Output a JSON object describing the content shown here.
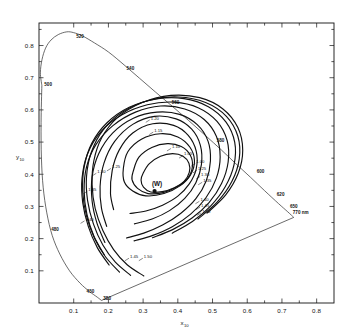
{
  "figure": {
    "kind": "cie-1964-chromaticity-diagram",
    "background": "#ffffff",
    "ink": "#111111"
  },
  "axes": {
    "x_title": "x",
    "x_subscript": "10",
    "y_title": "y",
    "y_subscript": "10",
    "x_ticks": [
      "0.1",
      "0.2",
      "0.3",
      "0.4",
      "0.5",
      "0.6",
      "0.7",
      "0.8"
    ],
    "y_ticks": [
      "0.1",
      "0.2",
      "0.3",
      "0.4",
      "0.5",
      "0.6",
      "0.7",
      "0.8"
    ],
    "xlim": [
      0.0,
      0.85
    ],
    "ylim": [
      0.0,
      0.87
    ]
  },
  "marker": {
    "label": "(W)",
    "x": 0.333,
    "y": 0.348
  },
  "wavelength_labels": [
    {
      "label": "520",
      "x": 0.1,
      "y": 0.82
    },
    {
      "label": "540",
      "x": 0.245,
      "y": 0.72
    },
    {
      "label": "560",
      "x": 0.375,
      "y": 0.615
    },
    {
      "label": "580",
      "x": 0.505,
      "y": 0.495
    },
    {
      "label": "600",
      "x": 0.62,
      "y": 0.4
    },
    {
      "label": "620",
      "x": 0.678,
      "y": 0.33
    },
    {
      "label": "650",
      "x": 0.716,
      "y": 0.292
    },
    {
      "label": "770 nm",
      "x": 0.724,
      "y": 0.272
    },
    {
      "label": "500",
      "x": 0.008,
      "y": 0.672
    },
    {
      "label": "480",
      "x": 0.028,
      "y": 0.22
    },
    {
      "label": "450",
      "x": 0.13,
      "y": 0.027
    },
    {
      "label": "380",
      "x": 0.178,
      "y": 0.005
    }
  ],
  "contour_labels": [
    {
      "label": "1.20",
      "x": 0.312,
      "y": 0.566
    },
    {
      "label": "1.15",
      "x": 0.322,
      "y": 0.528
    },
    {
      "label": "1.10",
      "x": 0.373,
      "y": 0.477
    },
    {
      "label": "1.05",
      "x": 0.408,
      "y": 0.455
    },
    {
      "label": "1.00",
      "x": 0.443,
      "y": 0.43
    },
    {
      "label": "1.25",
      "x": 0.448,
      "y": 0.409
    },
    {
      "label": "1.30",
      "x": 0.457,
      "y": 0.39
    },
    {
      "label": "1.35",
      "x": 0.463,
      "y": 0.372
    },
    {
      "label": "1.40",
      "x": 0.455,
      "y": 0.313
    },
    {
      "label": "1.45",
      "x": 0.457,
      "y": 0.295
    },
    {
      "label": "1.50",
      "x": 0.46,
      "y": 0.277
    },
    {
      "label": "1.30",
      "x": 0.158,
      "y": 0.4
    },
    {
      "label": "1.25",
      "x": 0.2,
      "y": 0.415
    },
    {
      "label": "1.35",
      "x": 0.132,
      "y": 0.344
    },
    {
      "label": "1.40",
      "x": 0.124,
      "y": 0.252
    },
    {
      "label": "1.45",
      "x": 0.252,
      "y": 0.136
    },
    {
      "label": "1.50",
      "x": 0.292,
      "y": 0.136
    }
  ],
  "chart_data": {
    "type": "line",
    "title": "",
    "xlabel": "x10",
    "ylabel": "y10",
    "xlim": [
      0.0,
      0.85
    ],
    "ylim": [
      0.0,
      0.87
    ],
    "grid": false,
    "legend": "none",
    "series": [
      {
        "name": "spectral locus (CIE 1964 10-deg observer)",
        "kind": "closed-curve",
        "points": [
          [
            0.0082,
            0.676
          ],
          [
            0.004,
            0.715
          ],
          [
            0.0086,
            0.756
          ],
          [
            0.019,
            0.792
          ],
          [
            0.0345,
            0.817
          ],
          [
            0.0555,
            0.834
          ],
          [
            0.08,
            0.8425
          ],
          [
            0.1,
            0.84
          ],
          [
            0.125,
            0.83
          ],
          [
            0.16,
            0.808
          ],
          [
            0.2,
            0.78
          ],
          [
            0.245,
            0.74
          ],
          [
            0.29,
            0.698
          ],
          [
            0.335,
            0.656
          ],
          [
            0.38,
            0.615
          ],
          [
            0.43,
            0.568
          ],
          [
            0.48,
            0.52
          ],
          [
            0.525,
            0.476
          ],
          [
            0.565,
            0.435
          ],
          [
            0.61,
            0.39
          ],
          [
            0.65,
            0.349
          ],
          [
            0.69,
            0.309
          ],
          [
            0.717,
            0.283
          ],
          [
            0.734,
            0.266
          ]
        ]
      },
      {
        "name": "spectral locus lower branch",
        "kind": "open-curve",
        "points": [
          [
            0.0082,
            0.676
          ],
          [
            0.006,
            0.56
          ],
          [
            0.007,
            0.45
          ],
          [
            0.012,
            0.36
          ],
          [
            0.0225,
            0.28
          ],
          [
            0.038,
            0.21
          ],
          [
            0.06,
            0.152
          ],
          [
            0.088,
            0.1
          ],
          [
            0.118,
            0.062
          ],
          [
            0.145,
            0.036
          ],
          [
            0.168,
            0.018
          ],
          [
            0.18,
            0.008
          ]
        ]
      },
      {
        "name": "line of purples",
        "kind": "segment",
        "points": [
          [
            0.18,
            0.008
          ],
          [
            0.734,
            0.266
          ]
        ]
      },
      {
        "name": "contour 1.00",
        "kind": "closed-loop",
        "value": 1.0,
        "points": [
          [
            0.3,
            0.403
          ],
          [
            0.318,
            0.433
          ],
          [
            0.35,
            0.456
          ],
          [
            0.385,
            0.464
          ],
          [
            0.415,
            0.456
          ],
          [
            0.432,
            0.434
          ],
          [
            0.433,
            0.406
          ],
          [
            0.418,
            0.378
          ],
          [
            0.39,
            0.358
          ],
          [
            0.355,
            0.346
          ],
          [
            0.322,
            0.345
          ],
          [
            0.301,
            0.36
          ],
          [
            0.294,
            0.382
          ]
        ]
      },
      {
        "name": "contour 1.05",
        "kind": "closed-loop",
        "value": 1.05,
        "points": [
          [
            0.272,
            0.411
          ],
          [
            0.288,
            0.453
          ],
          [
            0.325,
            0.483
          ],
          [
            0.37,
            0.495
          ],
          [
            0.41,
            0.486
          ],
          [
            0.436,
            0.459
          ],
          [
            0.442,
            0.424
          ],
          [
            0.429,
            0.388
          ],
          [
            0.398,
            0.361
          ],
          [
            0.357,
            0.343
          ],
          [
            0.314,
            0.34
          ],
          [
            0.284,
            0.356
          ],
          [
            0.268,
            0.383
          ]
        ]
      },
      {
        "name": "contour 1.10",
        "kind": "closed-loop",
        "value": 1.1,
        "points": [
          [
            0.243,
            0.418
          ],
          [
            0.256,
            0.47
          ],
          [
            0.295,
            0.509
          ],
          [
            0.35,
            0.526
          ],
          [
            0.4,
            0.516
          ],
          [
            0.435,
            0.484
          ],
          [
            0.448,
            0.442
          ],
          [
            0.437,
            0.399
          ],
          [
            0.406,
            0.364
          ],
          [
            0.36,
            0.34
          ],
          [
            0.308,
            0.333
          ],
          [
            0.27,
            0.348
          ],
          [
            0.246,
            0.376
          ]
        ]
      },
      {
        "name": "contour 1.15",
        "kind": "open-curve",
        "value": 1.15,
        "points": [
          [
            0.215,
            0.29
          ],
          [
            0.206,
            0.34
          ],
          [
            0.211,
            0.412
          ],
          [
            0.231,
            0.475
          ],
          [
            0.27,
            0.528
          ],
          [
            0.328,
            0.557
          ],
          [
            0.388,
            0.552
          ],
          [
            0.43,
            0.521
          ],
          [
            0.453,
            0.472
          ],
          [
            0.453,
            0.417
          ],
          [
            0.433,
            0.37
          ],
          [
            0.4,
            0.332
          ],
          [
            0.356,
            0.304
          ],
          [
            0.308,
            0.286
          ],
          [
            0.262,
            0.278
          ]
        ]
      },
      {
        "name": "contour 1.20",
        "kind": "open-curve",
        "value": 1.2,
        "points": [
          [
            0.195,
            0.238
          ],
          [
            0.18,
            0.295
          ],
          [
            0.176,
            0.362
          ],
          [
            0.187,
            0.434
          ],
          [
            0.218,
            0.502
          ],
          [
            0.27,
            0.555
          ],
          [
            0.333,
            0.58
          ],
          [
            0.395,
            0.572
          ],
          [
            0.44,
            0.54
          ],
          [
            0.465,
            0.49
          ],
          [
            0.468,
            0.43
          ],
          [
            0.452,
            0.374
          ],
          [
            0.42,
            0.325
          ],
          [
            0.376,
            0.287
          ],
          [
            0.326,
            0.261
          ],
          [
            0.275,
            0.246
          ]
        ]
      },
      {
        "name": "contour 1.25",
        "kind": "open-curve",
        "value": 1.25,
        "points": [
          [
            0.19,
            0.188
          ],
          [
            0.167,
            0.248
          ],
          [
            0.153,
            0.317
          ],
          [
            0.153,
            0.392
          ],
          [
            0.172,
            0.464
          ],
          [
            0.212,
            0.528
          ],
          [
            0.272,
            0.574
          ],
          [
            0.34,
            0.593
          ],
          [
            0.405,
            0.586
          ],
          [
            0.456,
            0.554
          ],
          [
            0.487,
            0.503
          ],
          [
            0.494,
            0.442
          ],
          [
            0.482,
            0.38
          ],
          [
            0.452,
            0.324
          ],
          [
            0.408,
            0.278
          ],
          [
            0.356,
            0.242
          ],
          [
            0.302,
            0.217
          ],
          [
            0.252,
            0.202
          ]
        ]
      },
      {
        "name": "contour 1.30",
        "kind": "open-curve",
        "value": 1.3,
        "points": [
          [
            0.188,
            0.15
          ],
          [
            0.158,
            0.208
          ],
          [
            0.138,
            0.276
          ],
          [
            0.13,
            0.349
          ],
          [
            0.137,
            0.423
          ],
          [
            0.164,
            0.492
          ],
          [
            0.213,
            0.551
          ],
          [
            0.278,
            0.593
          ],
          [
            0.35,
            0.612
          ],
          [
            0.42,
            0.603
          ],
          [
            0.476,
            0.57
          ],
          [
            0.511,
            0.518
          ],
          [
            0.522,
            0.454
          ],
          [
            0.511,
            0.388
          ],
          [
            0.481,
            0.327
          ],
          [
            0.437,
            0.276
          ],
          [
            0.384,
            0.237
          ],
          [
            0.328,
            0.21
          ],
          [
            0.274,
            0.193
          ]
        ]
      },
      {
        "name": "contour 1.35",
        "kind": "open-curve",
        "value": 1.35,
        "points": [
          [
            0.202,
            0.118
          ],
          [
            0.168,
            0.172
          ],
          [
            0.142,
            0.238
          ],
          [
            0.126,
            0.312
          ],
          [
            0.124,
            0.388
          ],
          [
            0.14,
            0.464
          ],
          [
            0.178,
            0.532
          ],
          [
            0.238,
            0.584
          ],
          [
            0.312,
            0.616
          ],
          [
            0.39,
            0.624
          ],
          [
            0.46,
            0.606
          ],
          [
            0.513,
            0.564
          ],
          [
            0.542,
            0.505
          ],
          [
            0.545,
            0.438
          ],
          [
            0.526,
            0.371
          ],
          [
            0.49,
            0.312
          ],
          [
            0.441,
            0.264
          ],
          [
            0.385,
            0.228
          ],
          [
            0.327,
            0.203
          ]
        ]
      },
      {
        "name": "contour 1.40",
        "kind": "open-curve",
        "value": 1.4,
        "points": [
          [
            0.232,
            0.096
          ],
          [
            0.192,
            0.143
          ],
          [
            0.16,
            0.201
          ],
          [
            0.137,
            0.27
          ],
          [
            0.126,
            0.345
          ],
          [
            0.13,
            0.422
          ],
          [
            0.152,
            0.496
          ],
          [
            0.196,
            0.56
          ],
          [
            0.26,
            0.608
          ],
          [
            0.338,
            0.634
          ],
          [
            0.418,
            0.635
          ],
          [
            0.488,
            0.61
          ],
          [
            0.539,
            0.562
          ],
          [
            0.564,
            0.499
          ],
          [
            0.562,
            0.43
          ],
          [
            0.537,
            0.362
          ],
          [
            0.495,
            0.302
          ],
          [
            0.442,
            0.253
          ],
          [
            0.384,
            0.217
          ]
        ]
      },
      {
        "name": "contour 1.45",
        "kind": "open-curve",
        "value": 1.45,
        "points": [
          [
            0.264,
            0.086
          ],
          [
            0.22,
            0.127
          ],
          [
            0.184,
            0.18
          ],
          [
            0.157,
            0.245
          ],
          [
            0.14,
            0.318
          ],
          [
            0.137,
            0.394
          ],
          [
            0.151,
            0.469
          ],
          [
            0.185,
            0.538
          ],
          [
            0.242,
            0.594
          ],
          [
            0.318,
            0.63
          ],
          [
            0.402,
            0.64
          ],
          [
            0.48,
            0.623
          ],
          [
            0.54,
            0.58
          ],
          [
            0.573,
            0.518
          ],
          [
            0.577,
            0.448
          ],
          [
            0.556,
            0.378
          ],
          [
            0.514,
            0.314
          ],
          [
            0.458,
            0.261
          ]
        ]
      },
      {
        "name": "contour 1.50",
        "kind": "open-curve",
        "value": 1.5,
        "points": [
          [
            0.302,
            0.084
          ],
          [
            0.254,
            0.119
          ],
          [
            0.215,
            0.166
          ],
          [
            0.184,
            0.225
          ],
          [
            0.162,
            0.293
          ],
          [
            0.153,
            0.367
          ],
          [
            0.158,
            0.442
          ],
          [
            0.181,
            0.514
          ],
          [
            0.226,
            0.576
          ],
          [
            0.296,
            0.622
          ],
          [
            0.38,
            0.645
          ],
          [
            0.463,
            0.638
          ],
          [
            0.53,
            0.603
          ],
          [
            0.573,
            0.545
          ],
          [
            0.587,
            0.475
          ],
          [
            0.574,
            0.403
          ],
          [
            0.538,
            0.336
          ],
          [
            0.484,
            0.279
          ]
        ]
      }
    ]
  }
}
